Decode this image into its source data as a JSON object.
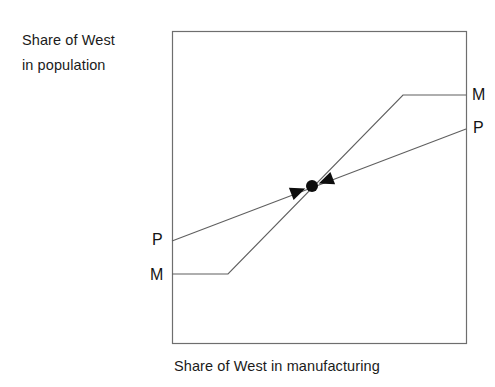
{
  "figure": {
    "background_color": "#ffffff",
    "width": 495,
    "height": 387
  },
  "axes": {
    "y_caption_line1": "Share of West",
    "y_caption_line2": "in population",
    "x_caption": "Share of West in manufacturing",
    "frame": {
      "left": 172,
      "top": 31,
      "right": 466,
      "bottom": 343,
      "border_color": "#6e6e6e",
      "border_width": 1.2
    }
  },
  "curve_labels": {
    "m_right": "M",
    "p_right": "P",
    "p_left": "P",
    "m_left": "M"
  },
  "chart_data": {
    "type": "line",
    "title": "",
    "subtitle": "",
    "xlabel": "Share of West in manufacturing",
    "ylabel": "Share of West in population",
    "grid": false,
    "legend_position": "none",
    "axis_ticks": false,
    "xlim": [
      0,
      1
    ],
    "ylim": [
      0,
      1
    ],
    "line_color": "#5f5f5f",
    "line_width": 1.15,
    "series": [
      {
        "name": "M",
        "label": "M",
        "description": "Manufacturing-share reaction schedule: flat at a low level, then rising steeply, then flat at a high plateau",
        "points_px": [
          [
            172,
            274
          ],
          [
            228,
            274
          ],
          [
            403,
            95
          ],
          [
            466,
            95
          ]
        ],
        "x": [
          0.0,
          0.19,
          0.785,
          1.0
        ],
        "y": [
          0.221,
          0.221,
          0.795,
          0.795
        ]
      },
      {
        "name": "P",
        "label": "P",
        "description": "Population-share reaction schedule: gently upward sloping straight line",
        "points_px": [
          [
            172,
            241
          ],
          [
            466,
            129
          ]
        ],
        "x": [
          0.0,
          1.0
        ],
        "y": [
          0.327,
          0.686
        ]
      }
    ],
    "annotations": [
      {
        "kind": "equilibrium-point",
        "label": "",
        "point_px": [
          312,
          186
        ],
        "x": 0.476,
        "y": 0.503,
        "marker": "filled-circle",
        "marker_color": "#0d0d0d",
        "marker_radius_px": 6,
        "arrows": "two inward-pointing triangular arrowheads along the P schedule, converging on the equilibrium point",
        "arrow_color": "#0d0d0d"
      }
    ]
  }
}
